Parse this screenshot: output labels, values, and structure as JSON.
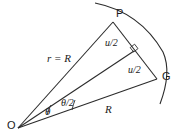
{
  "figure": {
    "name": "circular-arc-chord-geometry-diagram",
    "background_color": "#ffffff",
    "stroke_color": "#2b2b2b",
    "text_color": "#1a1a1a"
  },
  "points": {
    "origin": {
      "label": "O",
      "x": 18,
      "y": 128
    },
    "top": {
      "label": "P",
      "x": 113,
      "y": 22
    },
    "right": {
      "label": "G",
      "x": 157,
      "y": 79
    },
    "midpoint": {
      "label": "",
      "x": 134,
      "y": 51
    }
  },
  "labels": {
    "radius_top": "r = R",
    "chord_upper": "u/2",
    "chord_lower": "u/2",
    "radius_bottom": "R",
    "angle_full": "θ",
    "angle_half": "θ/2"
  },
  "markers": {
    "right_angle": "right-angle-square",
    "angle_arc_full": "angle-arc-theta",
    "angle_arc_half": "angle-arc-theta-half"
  }
}
